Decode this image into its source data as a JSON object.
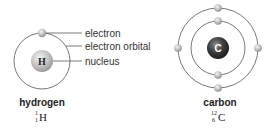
{
  "labels": {
    "electron": "electron",
    "electron_orbital": "electron orbital",
    "nucleus": "nucleus"
  },
  "atoms": [
    {
      "name": "hydrogen",
      "nucleus_symbol": "H",
      "isotope": {
        "mass_number": "1",
        "atomic_number": "1",
        "symbol": "H"
      },
      "shells": [
        1
      ],
      "nucleus_color": "#c8c8c8"
    },
    {
      "name": "carbon",
      "nucleus_symbol": "C",
      "isotope": {
        "mass_number": "12",
        "atomic_number": "6",
        "symbol": "C"
      },
      "shells": [
        2,
        4
      ],
      "nucleus_color": "#3a3a3a"
    }
  ],
  "colors": {
    "orbit": "#555555",
    "electron": "#bdbdbd",
    "leader_line": "#444444",
    "text": "#333333"
  }
}
